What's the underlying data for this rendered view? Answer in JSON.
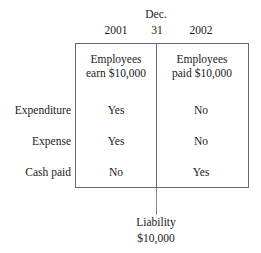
{
  "diagram": {
    "header": {
      "month": "Dec.",
      "day": "31",
      "year_left": "2001",
      "year_right": "2002"
    },
    "events": {
      "left_line1": "Employees",
      "left_line2": "earn $10,000",
      "right_line1": "Employees",
      "right_line2": "paid $10,000"
    },
    "rows": [
      {
        "label": "Expenditure",
        "left": "Yes",
        "right": "No"
      },
      {
        "label": "Expense",
        "left": "Yes",
        "right": "No"
      },
      {
        "label": "Cash paid",
        "left": "No",
        "right": "Yes"
      }
    ],
    "callout": {
      "title": "Liability",
      "amount": "$10,000"
    },
    "colors": {
      "border": "#6a6a6a",
      "text": "#1a1a1a",
      "background": "#ffffff"
    }
  }
}
